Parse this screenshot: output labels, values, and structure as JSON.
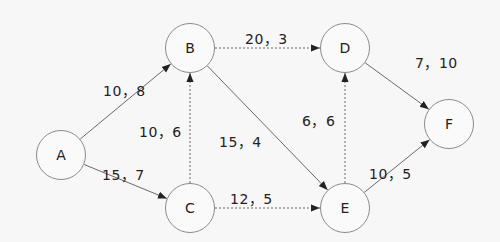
{
  "nodes": [
    {
      "id": "A",
      "label": "A",
      "cx": 61,
      "cy": 155
    },
    {
      "id": "B",
      "label": "B",
      "cx": 190,
      "cy": 48
    },
    {
      "id": "C",
      "label": "C",
      "cx": 190,
      "cy": 208
    },
    {
      "id": "D",
      "label": "D",
      "cx": 345,
      "cy": 48
    },
    {
      "id": "E",
      "label": "E",
      "cx": 345,
      "cy": 208
    },
    {
      "id": "F",
      "label": "F",
      "cx": 449,
      "cy": 124
    }
  ],
  "edges": [
    {
      "from": "A",
      "to": "B",
      "label": "10，8",
      "style": "solid",
      "lx": 103,
      "ly": 80
    },
    {
      "from": "A",
      "to": "C",
      "label": "15，7",
      "style": "solid",
      "lx": 102,
      "ly": 164
    },
    {
      "from": "B",
      "to": "D",
      "label": "20，3",
      "style": "dashed",
      "lx": 245,
      "ly": 28
    },
    {
      "from": "B",
      "to": "E",
      "label": "15，4",
      "style": "solid",
      "lx": 219,
      "ly": 131
    },
    {
      "from": "C",
      "to": "B",
      "label": "10，6",
      "style": "dashed",
      "lx": 139,
      "ly": 121
    },
    {
      "from": "C",
      "to": "E",
      "label": "12，5",
      "style": "dashed",
      "lx": 230,
      "ly": 188
    },
    {
      "from": "D",
      "to": "F",
      "label": "7，10",
      "style": "solid",
      "lx": 415,
      "ly": 52
    },
    {
      "from": "E",
      "to": "D",
      "label": "6，6",
      "style": "dashed",
      "lx": 302,
      "ly": 110
    },
    {
      "from": "E",
      "to": "F",
      "label": "10，5",
      "style": "solid",
      "lx": 369,
      "ly": 163
    }
  ],
  "colors": {
    "edge": "#6a6a6a",
    "node_border": "#8a8a8a",
    "text": "#222222"
  }
}
